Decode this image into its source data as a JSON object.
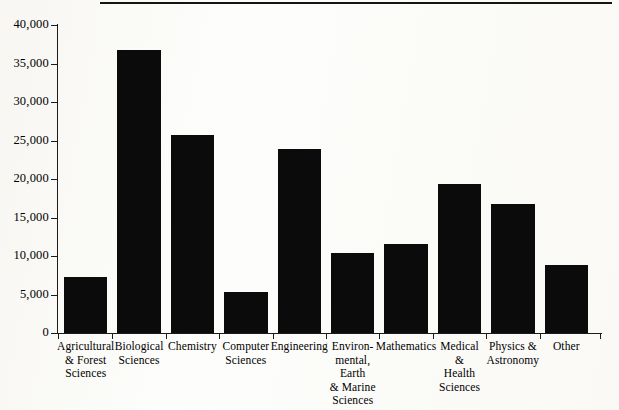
{
  "figure": {
    "background_color": "#fdfdfb",
    "bar_color": "#0b0b0b",
    "axis_color": "#1b1b1b",
    "top_rule": true
  },
  "chart_data": {
    "type": "bar",
    "title": "",
    "xlabel": "",
    "ylabel": "",
    "ylim": [
      0,
      40000
    ],
    "grid": false,
    "legend": false,
    "ytick_labels": [
      "0",
      "5,000",
      "10,000",
      "15,000",
      "20,000",
      "25,000",
      "30,000",
      "35,000",
      "40,000"
    ],
    "ytick_values": [
      0,
      5000,
      10000,
      15000,
      20000,
      25000,
      30000,
      35000,
      40000
    ],
    "categories": [
      "Agricultural\n& Forest\nSciences",
      "Biological\nSciences",
      "Chemistry",
      "Computer\nSciences",
      "Engineering",
      "Environ-\nmental, Earth\n& Marine\nSciences",
      "Mathematics",
      "Medical\n&\nHealth\nSciences",
      "Physics &\nAstronomy",
      "Other"
    ],
    "values": [
      7300,
      36700,
      25700,
      5350,
      23950,
      10350,
      11550,
      19350,
      16750,
      8850
    ]
  }
}
